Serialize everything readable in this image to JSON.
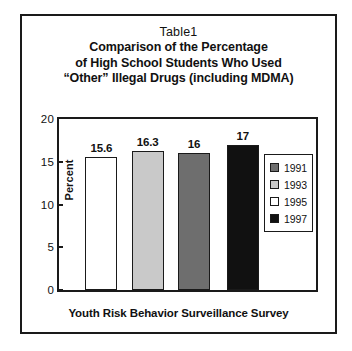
{
  "figure": {
    "title_lines": [
      "Table1",
      "Comparison of the Percentage",
      "of High School Students Who Used",
      "“Other” Illegal Drugs (including MDMA)"
    ]
  },
  "chart_data": {
    "type": "bar",
    "title": "Table1 Comparison of the Percentage of High School Students Who Used “Other” Illegal Drugs (including MDMA)",
    "xlabel": "Youth Risk Behavior Surveillance Survey",
    "ylabel": "Percent",
    "ylim": [
      0,
      20
    ],
    "yticks": [
      "0",
      "5",
      "10",
      "15",
      "20"
    ],
    "grid": false,
    "legend_position": "right-inside",
    "categories": [
      "1995",
      "1993",
      "1991",
      "1997"
    ],
    "values": [
      15.6,
      16.3,
      16,
      17
    ],
    "value_labels": [
      "15.6",
      "16.3",
      "16",
      "17"
    ],
    "bar_colors": [
      "#ffffff",
      "#c9c9c9",
      "#6e6e6e",
      "#111111"
    ],
    "bars": [
      {
        "year": "1995",
        "value": 15.6,
        "label": "15.6",
        "color": "#ffffff"
      },
      {
        "year": "1993",
        "value": 16.3,
        "label": "16.3",
        "color": "#c9c9c9"
      },
      {
        "year": "1991",
        "value": 16,
        "label": "16",
        "color": "#6e6e6e"
      },
      {
        "year": "1997",
        "value": 17,
        "label": "17",
        "color": "#111111"
      }
    ],
    "legend": [
      {
        "label": "1991",
        "color": "#6e6e6e"
      },
      {
        "label": "1993",
        "color": "#c9c9c9"
      },
      {
        "label": "1995",
        "color": "#ffffff"
      },
      {
        "label": "1997",
        "color": "#111111"
      }
    ]
  }
}
